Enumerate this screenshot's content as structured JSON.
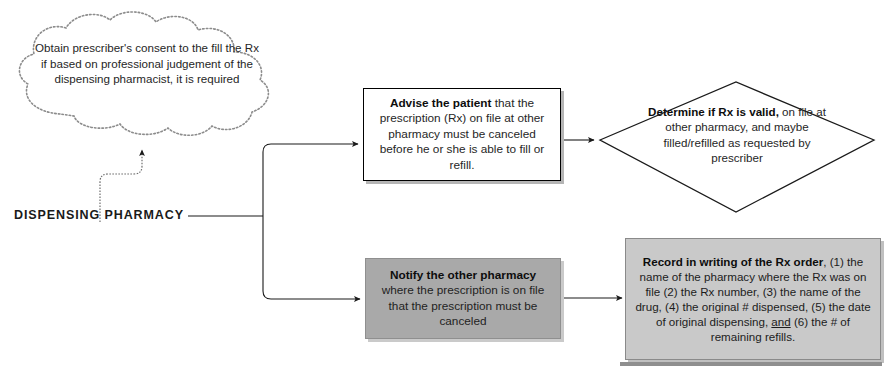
{
  "diagram": {
    "root": {
      "label": "DISPENSING PHARMACY"
    },
    "nodes": {
      "cloud": {
        "shape": "cloud",
        "name": "obtain-prescriber-consent",
        "text": "Obtain prescriber's consent to the fill the Rx if based on professional judgement of the dispensing pharmacist, it is required",
        "fill": "#ffffff",
        "outline": "#8c8c8c",
        "outline_style": "dotted"
      },
      "advise": {
        "shape": "process",
        "name": "advise-the-patient",
        "emphasis": "Advise the patient",
        "rest": " that the prescription (Rx) on file at other pharmacy must be canceled before he or she is able to fill or refill.",
        "fill": "#ffffff",
        "outline": "#000000"
      },
      "decision": {
        "shape": "decision",
        "name": "determine-if-rx-is-valid",
        "emphasis": "Determine if Rx is valid,",
        "rest": " on file at other pharmacy, and maybe filled/refilled as requested by prescriber",
        "fill": "#ffffff",
        "outline": "#1a1a1a"
      },
      "notify": {
        "shape": "process",
        "name": "notify-the-other-pharmacy",
        "emphasis": "Notify the other pharmacy",
        "rest": " where the prescription is on file that the prescription must be canceled",
        "fill": "#a9a9a9",
        "outline": "#8f8f8f"
      },
      "record": {
        "shape": "process",
        "name": "record-in-writing-of-rx-order",
        "emphasis": "Record in writing of the Rx order",
        "rest_a": ", (1) the name of the pharmacy where the Rx was on file (2) the Rx number, (3) the name of the drug, (4) the original # dispensed, (5) the date of original dispensing, ",
        "underlined": "and",
        "rest_b": " (6) the # of remaining refills.",
        "fill": "#c9c9c9",
        "outline": "#8a8a8a"
      }
    },
    "connectors": [
      {
        "name": "root-to-cloud",
        "from": "DISPENSING PHARMACY",
        "to": "Obtain prescriber's consent",
        "arrow": true
      },
      {
        "name": "root-to-advise",
        "from": "DISPENSING PHARMACY",
        "to": "Advise the patient",
        "arrow": true
      },
      {
        "name": "root-to-notify",
        "from": "DISPENSING PHARMACY",
        "to": "Notify the other pharmacy",
        "arrow": true
      },
      {
        "name": "advise-to-decision",
        "from": "Advise the patient",
        "to": "Determine if Rx is valid",
        "arrow": true
      },
      {
        "name": "notify-to-record",
        "from": "Notify the other pharmacy",
        "to": "Record in writing of the Rx order",
        "arrow": true
      }
    ]
  }
}
